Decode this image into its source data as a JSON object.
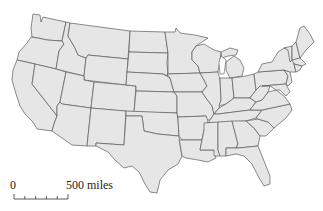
{
  "map": {
    "title": "United States",
    "type": "outline map of contiguous US states",
    "fill_color": "#e6e6e6",
    "border_color": "#5a5a5a",
    "background_color": "#ffffff"
  },
  "scale_bar": {
    "min_label": "0",
    "max_label": "500 miles",
    "ticks": 6
  }
}
